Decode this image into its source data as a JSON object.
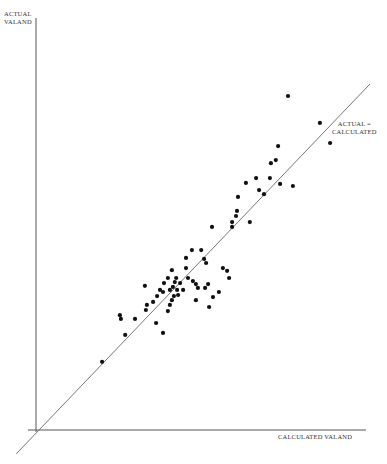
{
  "chart_data": {
    "type": "scatter",
    "title": "",
    "xlabel": "CALCULATED VALAND",
    "ylabel": "ACTUAL\nVALAND",
    "xlim": [
      0,
      100
    ],
    "ylim": [
      0,
      121
    ],
    "grid": false,
    "legend": null,
    "annotations": [
      {
        "text": "ACTUAL =\nCALCULATED",
        "type": "reference-line",
        "equation": "y = x"
      }
    ],
    "reference_line": {
      "label": "ACTUAL = CALCULATED",
      "from": [
        -6,
        -7
      ],
      "to": [
        101.5,
        101.5
      ]
    },
    "series": [
      {
        "name": "observations",
        "points": [
          [
            20.1,
            20.0
          ],
          [
            27.1,
            27.9
          ],
          [
            25.5,
            33.7
          ],
          [
            25.8,
            32.6
          ],
          [
            30.1,
            32.6
          ],
          [
            33.1,
            42.3
          ],
          [
            36.5,
            31.4
          ],
          [
            38.6,
            28.5
          ],
          [
            33.7,
            36.7
          ],
          [
            35.6,
            37.6
          ],
          [
            33.4,
            35.2
          ],
          [
            36.8,
            39.3
          ],
          [
            37.7,
            41.1
          ],
          [
            38.9,
            43.1
          ],
          [
            40.1,
            44.6
          ],
          [
            41.3,
            46.9
          ],
          [
            38.6,
            40.5
          ],
          [
            40.7,
            41.1
          ],
          [
            41.6,
            42.0
          ],
          [
            42.2,
            43.4
          ],
          [
            42.6,
            44.6
          ],
          [
            43.8,
            43.1
          ],
          [
            44.7,
            41.1
          ],
          [
            43.2,
            39.6
          ],
          [
            41.3,
            38.1
          ],
          [
            40.7,
            36.7
          ],
          [
            40.1,
            34.9
          ],
          [
            41.9,
            39.3
          ],
          [
            42.9,
            41.1
          ],
          [
            45.6,
            50.5
          ],
          [
            45.6,
            47.5
          ],
          [
            46.2,
            44.6
          ],
          [
            47.4,
            52.8
          ],
          [
            47.7,
            43.7
          ],
          [
            48.6,
            42.8
          ],
          [
            48.6,
            38.1
          ],
          [
            49.2,
            41.7
          ],
          [
            50.2,
            52.8
          ],
          [
            51.1,
            50.2
          ],
          [
            51.4,
            41.7
          ],
          [
            51.7,
            49.0
          ],
          [
            52.3,
            42.8
          ],
          [
            52.6,
            36.1
          ],
          [
            53.5,
            59.6
          ],
          [
            53.8,
            39.0
          ],
          [
            55.6,
            40.5
          ],
          [
            56.8,
            47.5
          ],
          [
            58.1,
            46.7
          ],
          [
            58.7,
            44.6
          ],
          [
            59.6,
            59.6
          ],
          [
            59.6,
            61.0
          ],
          [
            60.8,
            62.8
          ],
          [
            61.1,
            64.3
          ],
          [
            61.4,
            68.4
          ],
          [
            63.8,
            72.5
          ],
          [
            65.0,
            61.0
          ],
          [
            66.9,
            73.9
          ],
          [
            67.8,
            70.4
          ],
          [
            69.3,
            69.2
          ],
          [
            71.1,
            73.9
          ],
          [
            71.4,
            78.3
          ],
          [
            72.9,
            79.2
          ],
          [
            74.2,
            72.2
          ],
          [
            73.6,
            83.3
          ],
          [
            76.6,
            98.0
          ],
          [
            78.1,
            71.6
          ],
          [
            86.3,
            90.1
          ],
          [
            89.4,
            84.2
          ]
        ]
      }
    ]
  },
  "labels": {
    "ylabel": "ACTUAL\nVALAND",
    "xlabel": "CALCULATED VALAND",
    "line_label": "ACTUAL =\nCALCULATED"
  },
  "style": {
    "axis_color": "#555555",
    "point_color": "#111111",
    "line_color": "#666666"
  }
}
